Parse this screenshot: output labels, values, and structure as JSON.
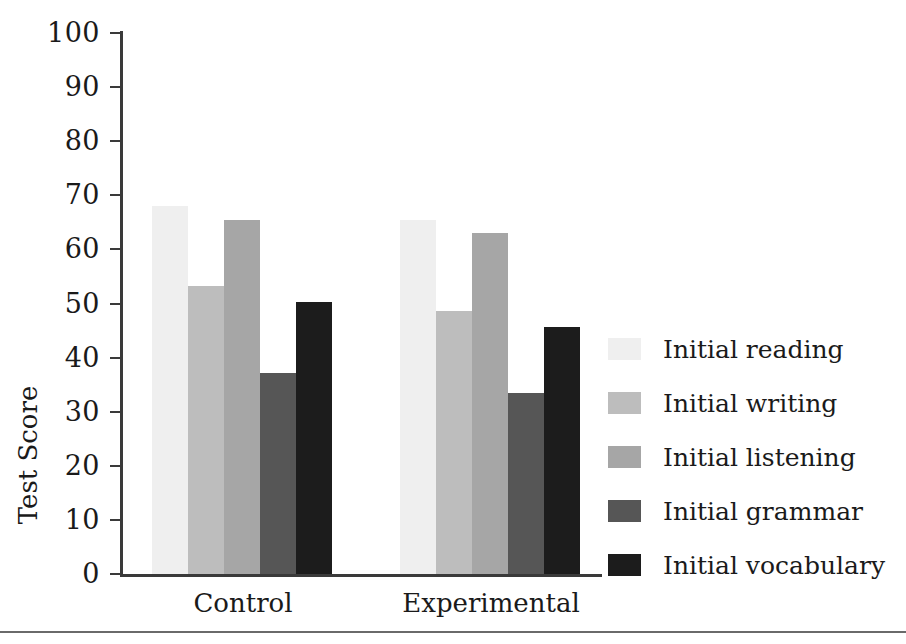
{
  "chart_data": {
    "type": "bar",
    "title": "",
    "subtitle": "",
    "xlabel": "",
    "ylabel": "Test Score",
    "ylim": [
      0,
      100
    ],
    "ytick_step": 10,
    "ytick_labels": [
      "100",
      "90",
      "80",
      "70",
      "60",
      "50",
      "40",
      "30",
      "20",
      "10",
      "0"
    ],
    "ytick_values": [
      100,
      90,
      80,
      70,
      60,
      50,
      40,
      30,
      20,
      10,
      0
    ],
    "grid": false,
    "legend_position": "right",
    "categories": [
      "Control",
      "Experimental"
    ],
    "series": [
      {
        "name": "Initial reading",
        "color": "#efefef",
        "values": [
          68.0,
          65.5
        ]
      },
      {
        "name": "Initial writing",
        "color": "#bdbdbd",
        "values": [
          53.3,
          48.6
        ]
      },
      {
        "name": "Initial listening",
        "color": "#a6a6a6",
        "values": [
          65.5,
          63.0
        ]
      },
      {
        "name": "Initial grammar",
        "color": "#565656",
        "values": [
          37.2,
          33.5
        ]
      },
      {
        "name": "Initial vocabulary",
        "color": "#1c1c1c",
        "values": [
          50.2,
          45.7
        ]
      }
    ],
    "axis_color": "#3a3a3a",
    "text_color": "#1a1a1a",
    "background_color": "#ffffff"
  }
}
